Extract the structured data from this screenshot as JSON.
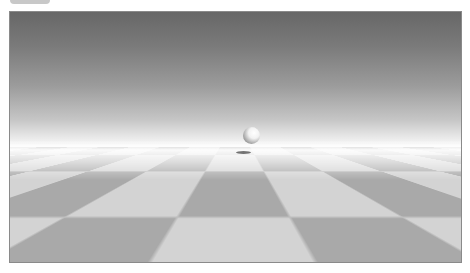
{
  "toolbar": {
    "label": "· · · · · · ·"
  },
  "scene": {
    "sky_top_color": "#676767",
    "horizon_color": "#fbfbfb",
    "checker_light": "#d3d3d3",
    "checker_dark": "#a9a9a9",
    "objects": [
      "sphere",
      "sphere-shadow",
      "checkered-ground-plane"
    ]
  }
}
